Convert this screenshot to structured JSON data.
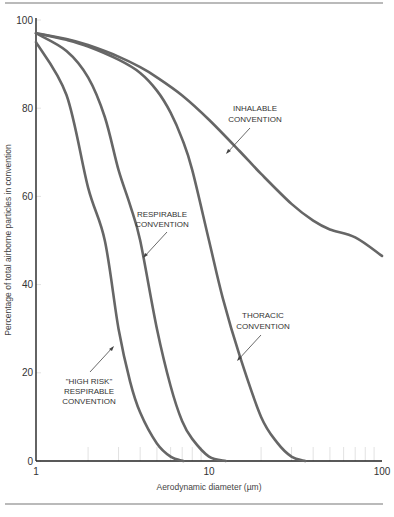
{
  "chart_data": {
    "type": "line",
    "title": "",
    "xlabel": "Aerodynamic diameter (µm)",
    "ylabel": "Percentage of total airborne particles in convention",
    "xscale": "log",
    "xlim": [
      1,
      100
    ],
    "ylim": [
      0,
      100
    ],
    "x_ticks": [
      1,
      10,
      100
    ],
    "x_tick_labels": [
      "1",
      "10",
      "100"
    ],
    "y_ticks": [
      0,
      20,
      40,
      60,
      80,
      100
    ],
    "y_tick_labels": [
      "0",
      "20",
      "40",
      "60",
      "80",
      "100"
    ],
    "grid": false,
    "series": [
      {
        "name": "Inhalable convention",
        "label_lines": [
          "INHALABLE",
          "CONVENTION"
        ],
        "x": [
          1,
          1.5,
          2,
          3,
          4,
          5,
          7,
          10,
          15,
          20,
          30,
          40,
          50,
          70,
          100
        ],
        "y": [
          97,
          95.7,
          94.3,
          91.7,
          89.3,
          87,
          82.9,
          77.4,
          70.3,
          65.1,
          58.3,
          54.5,
          52.5,
          50.7,
          46.5
        ]
      },
      {
        "name": "Thoracic convention",
        "label_lines": [
          "THORACIC",
          "CONVENTION"
        ],
        "x": [
          1,
          1.5,
          2,
          3,
          4,
          5,
          6,
          7,
          8,
          10,
          12,
          15,
          20,
          25,
          30,
          36
        ],
        "y": [
          97,
          95.5,
          94,
          91,
          88,
          84,
          79,
          73,
          66,
          50,
          37,
          24,
          10,
          4,
          1,
          0
        ]
      },
      {
        "name": "Respirable convention",
        "label_lines": [
          "RESPIRABLE",
          "CONVENTION"
        ],
        "x": [
          1,
          1.5,
          2,
          2.5,
          3,
          3.5,
          4,
          5,
          6,
          7,
          8,
          10,
          12.5
        ],
        "y": [
          97,
          93,
          87,
          78,
          66,
          58,
          50,
          30,
          17,
          9,
          5,
          1,
          0
        ]
      },
      {
        "name": "\"High risk\" respirable convention",
        "label_lines": [
          "\"HIGH RISK\"",
          "RESPIRABLE",
          "CONVENTION"
        ],
        "x": [
          1,
          1.5,
          2,
          2.5,
          3,
          3.5,
          4,
          5,
          6,
          7.1
        ],
        "y": [
          95,
          83,
          62,
          50,
          30,
          18,
          11,
          4,
          1,
          0
        ]
      }
    ],
    "annotations": [
      {
        "series": 0,
        "text_lines": [
          "INHALABLE",
          "CONVENTION"
        ]
      },
      {
        "series": 2,
        "text_lines": [
          "RESPIRABLE",
          "CONVENTION"
        ]
      },
      {
        "series": 1,
        "text_lines": [
          "THORACIC",
          "CONVENTION"
        ]
      },
      {
        "series": 3,
        "text_lines": [
          "\"HIGH RISK\"",
          "RESPIRABLE",
          "CONVENTION"
        ]
      }
    ],
    "colors": {
      "curve": "#666666",
      "axis": "#222222",
      "text": "#333333"
    }
  }
}
